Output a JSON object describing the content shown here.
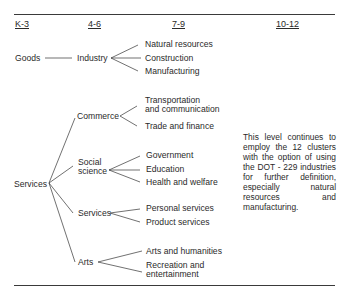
{
  "headers": [
    "K-3",
    "4-6",
    "7-9",
    "10-12"
  ],
  "levels": {
    "k3": {
      "goods": "Goods",
      "services": "Services"
    },
    "g46": {
      "industry": "Industry",
      "commerce": "Commerce",
      "social_science": [
        "Social",
        "science"
      ],
      "services": "Services",
      "arts": "Arts"
    },
    "g79": {
      "industry": [
        "Natural resources",
        "Construction",
        "Manufacturing"
      ],
      "commerce": [
        [
          "Transportation",
          "and communication"
        ],
        "Trade and finance"
      ],
      "social_science": [
        "Government",
        "Education",
        "Health and welfare"
      ],
      "services": [
        "Personal services",
        "Product services"
      ],
      "arts": [
        "Arts and humanities",
        [
          "Recreation and",
          "entertainment"
        ]
      ]
    }
  },
  "note": "This level continues to employ the 12 clusters with the option of using the DOT - 229 industries for further definition, especially natural resources and manufacturing."
}
